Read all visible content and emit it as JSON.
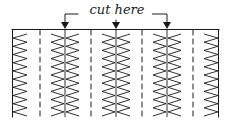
{
  "diagram": {
    "label": "cut here",
    "ink_color": "#1a1a1a",
    "cut_arrows": 3,
    "zigzag_columns": 3,
    "partial_columns": [
      "left",
      "right"
    ]
  }
}
